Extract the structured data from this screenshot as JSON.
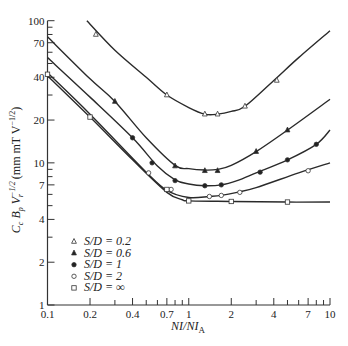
{
  "chart_data": {
    "type": "line",
    "title": "",
    "xlabel": "NI/NI_A",
    "ylabel": "C_c B_p V_r^-1/2 (mm mT V^-1/2)",
    "xscale": "log",
    "yscale": "log",
    "xlim": [
      0.1,
      10
    ],
    "ylim": [
      1,
      100
    ],
    "grid": false,
    "legend_position": "lower-left",
    "x_ticks": [
      "0.1",
      "0.2",
      "0.4",
      "0.7",
      "1",
      "2",
      "4",
      "7",
      "10"
    ],
    "y_ticks": [
      "1",
      "2",
      "4",
      "7",
      "10",
      "20",
      "40",
      "70",
      "100"
    ],
    "series": [
      {
        "name": "S/D = 0.2",
        "marker": "open-triangle",
        "curve": [
          [
            0.19,
            100
          ],
          [
            0.3,
            62
          ],
          [
            0.5,
            40
          ],
          [
            0.7,
            30
          ],
          [
            1.0,
            24.5
          ],
          [
            1.3,
            22
          ],
          [
            1.6,
            22
          ],
          [
            2.0,
            23
          ],
          [
            2.5,
            25
          ],
          [
            4,
            38
          ],
          [
            6,
            55
          ],
          [
            10,
            85
          ]
        ],
        "points": [
          [
            0.22,
            80
          ],
          [
            0.7,
            30
          ],
          [
            1.3,
            22
          ],
          [
            1.6,
            22
          ],
          [
            2.5,
            25
          ],
          [
            4.2,
            38
          ]
        ]
      },
      {
        "name": "S/D = 0.6",
        "marker": "filled-triangle",
        "curve": [
          [
            0.1,
            77
          ],
          [
            0.2,
            39
          ],
          [
            0.3,
            27
          ],
          [
            0.5,
            15
          ],
          [
            0.8,
            9.6
          ],
          [
            1.0,
            9.1
          ],
          [
            1.3,
            8.9
          ],
          [
            1.6,
            9
          ],
          [
            2,
            9.6
          ],
          [
            3,
            12
          ],
          [
            5,
            17
          ],
          [
            10,
            28
          ]
        ],
        "points": [
          [
            0.3,
            27
          ],
          [
            0.8,
            9.5
          ],
          [
            1.3,
            8.8
          ],
          [
            1.6,
            8.8
          ],
          [
            3,
            12
          ],
          [
            5,
            17
          ]
        ]
      },
      {
        "name": "S/D = 1",
        "marker": "filled-circle",
        "curve": [
          [
            0.1,
            55
          ],
          [
            0.2,
            29
          ],
          [
            0.4,
            15
          ],
          [
            0.6,
            9.5
          ],
          [
            0.8,
            7.6
          ],
          [
            1.0,
            7.1
          ],
          [
            1.3,
            6.9
          ],
          [
            1.7,
            7
          ],
          [
            2.2,
            7.5
          ],
          [
            3,
            8.5
          ],
          [
            5,
            10.5
          ],
          [
            8,
            13.5
          ],
          [
            10,
            17
          ]
        ],
        "points": [
          [
            0.4,
            15
          ],
          [
            0.55,
            10
          ],
          [
            0.8,
            7.5
          ],
          [
            1.3,
            6.9
          ],
          [
            1.7,
            7
          ],
          [
            3.2,
            8.6
          ],
          [
            5,
            10.5
          ],
          [
            8,
            13.5
          ]
        ]
      },
      {
        "name": "S/D = 2",
        "marker": "open-circle",
        "curve": [
          [
            0.1,
            43
          ],
          [
            0.2,
            22
          ],
          [
            0.5,
            8.6
          ],
          [
            0.7,
            6.4
          ],
          [
            1.0,
            5.7
          ],
          [
            1.4,
            5.8
          ],
          [
            1.7,
            5.9
          ],
          [
            2.2,
            6.2
          ],
          [
            3,
            6.7
          ],
          [
            6,
            8.5
          ],
          [
            10,
            10
          ]
        ],
        "points": [
          [
            0.52,
            8.5
          ],
          [
            0.75,
            6.5
          ],
          [
            1.4,
            5.8
          ],
          [
            1.7,
            5.9
          ],
          [
            2.3,
            6.2
          ],
          [
            7,
            8.8
          ]
        ]
      },
      {
        "name": "S/D = ∞",
        "marker": "open-square",
        "curve": [
          [
            0.1,
            41
          ],
          [
            0.2,
            21
          ],
          [
            0.4,
            10.5
          ],
          [
            0.7,
            6.2
          ],
          [
            0.9,
            5.5
          ],
          [
            1.0,
            5.4
          ],
          [
            2,
            5.35
          ],
          [
            5,
            5.3
          ],
          [
            10,
            5.3
          ]
        ],
        "points": [
          [
            0.1,
            42
          ],
          [
            0.2,
            21
          ],
          [
            0.7,
            6.5
          ],
          [
            1.0,
            5.4
          ],
          [
            2.0,
            5.35
          ],
          [
            5,
            5.3
          ]
        ]
      }
    ]
  },
  "legend": [
    {
      "symbol": "△",
      "label": "S/D = 0.2"
    },
    {
      "symbol": "▲",
      "label": "S/D = 0.6"
    },
    {
      "symbol": "●",
      "label": "S/D = 1"
    },
    {
      "symbol": "○",
      "label": "S/D = 2"
    },
    {
      "symbol": "□",
      "label": "S/D = ∞"
    }
  ],
  "axes": {
    "xlabel_main": "NI/NI",
    "xlabel_sub": "A",
    "ylabel_text": "C  B  V   (mm mT V   )"
  }
}
